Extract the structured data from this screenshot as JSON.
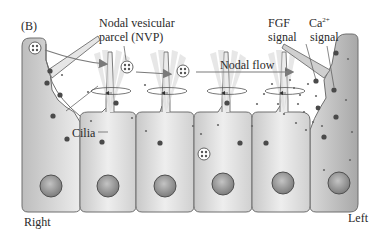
{
  "figure": {
    "panel_label": "(B)",
    "title_labels": {
      "nvp_line1": "Nodal vesicular",
      "nvp_line2": "parcel (NVP)",
      "nodal_flow": "Nodal flow",
      "fgf_line1": "FGF",
      "fgf_line2": "signal",
      "ca_line1": "Ca",
      "ca_superscript": "2+",
      "ca_line2": "signal",
      "cilia": "Cilia",
      "right": "Right",
      "left": "Left"
    },
    "colors": {
      "cell_fill": "#dcdcdc",
      "cell_fill_light": "#ececec",
      "cell_stroke": "#6e6e6e",
      "left_cell_fill": "#b4b4b4",
      "nucleus_fill": "#9a9a9a",
      "nucleus_stroke": "#505050",
      "arrow": "#7a7a7a",
      "receptor": "#4a4a4a",
      "dot": "#6a6a6a",
      "cilia_fan": "#d8d8d8"
    },
    "cells": {
      "count_bottom_row": 6,
      "tall_cells": [
        "right-edge",
        "left-edge"
      ]
    }
  }
}
